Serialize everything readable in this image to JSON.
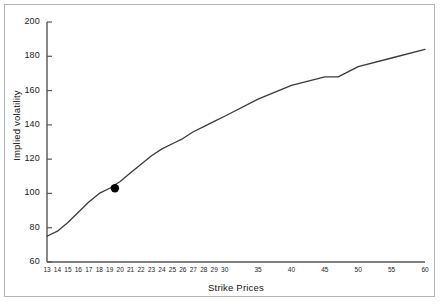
{
  "figure": {
    "background_color": "#ffffff",
    "frame_color": "#b4b4b4",
    "line_color": "#3a3a3a",
    "axis_color": "#555555",
    "marker_color": "#000000"
  },
  "chart_data": {
    "type": "line",
    "title": "",
    "xlabel": "Strike Prices",
    "ylabel": "Implied volatility",
    "xlim": [
      13,
      60
    ],
    "ylim": [
      60,
      200
    ],
    "grid": false,
    "legend": null,
    "ytick_labels": [
      "200",
      "180",
      "160",
      "140",
      "120",
      "100",
      "80",
      "60"
    ],
    "ytick_values": [
      200,
      180,
      160,
      140,
      120,
      100,
      80,
      60
    ],
    "xtick_labels": [
      "13",
      "14",
      "15",
      "16",
      "17",
      "18",
      "19",
      "20",
      "21",
      "22",
      "23",
      "24",
      "25",
      "26",
      "27",
      "28",
      "29",
      "30",
      "35",
      "40",
      "45",
      "50",
      "55",
      "60"
    ],
    "xtick_values": [
      13,
      14,
      15,
      16,
      17,
      18,
      19,
      20,
      21,
      22,
      23,
      24,
      25,
      26,
      27,
      28,
      29,
      30,
      35,
      40,
      45,
      50,
      55,
      60
    ],
    "x": [
      13,
      14,
      15,
      16,
      17,
      18,
      19,
      20,
      21,
      22,
      23,
      24,
      25,
      26,
      27,
      28,
      29,
      30,
      35,
      40,
      45,
      47,
      50,
      55,
      60
    ],
    "values": [
      75,
      78,
      83,
      89,
      95,
      100,
      103,
      107,
      112,
      117,
      122,
      126,
      129,
      132,
      136,
      139,
      142,
      145,
      155,
      163,
      168,
      168,
      174,
      179,
      184
    ],
    "series": [
      {
        "name": "Implied volatility curve",
        "x": [
          13,
          14,
          15,
          16,
          17,
          18,
          19,
          20,
          21,
          22,
          23,
          24,
          25,
          26,
          27,
          28,
          29,
          30,
          35,
          40,
          45,
          47,
          50,
          55,
          60
        ],
        "values": [
          75,
          78,
          83,
          89,
          95,
          100,
          103,
          107,
          112,
          117,
          122,
          126,
          129,
          132,
          136,
          139,
          142,
          145,
          155,
          163,
          168,
          168,
          174,
          179,
          184
        ]
      }
    ],
    "markers": [
      {
        "name": "highlighted-point",
        "x": 19.5,
        "y": 103,
        "shape": "circle",
        "color": "#000000"
      }
    ]
  }
}
